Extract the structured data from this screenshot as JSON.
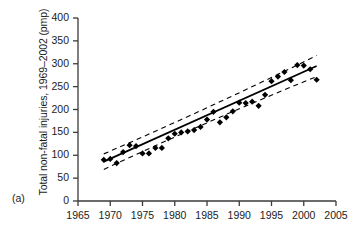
{
  "panel": {
    "label": "(a)"
  },
  "chart_data": {
    "type": "scatter",
    "title": "",
    "subtitle": "",
    "xlabel": "",
    "ylabel": "Total non-fatal injuries, 1969–2002 (pmp)",
    "xlim": [
      1965,
      2005
    ],
    "ylim": [
      0,
      400
    ],
    "xticks": [
      1965,
      1970,
      1975,
      1980,
      1985,
      1990,
      1995,
      2000,
      2005
    ],
    "yticks": [
      0,
      50,
      100,
      150,
      200,
      250,
      300,
      350,
      400
    ],
    "grid": false,
    "legend": null,
    "legend_position": "none",
    "marker": "diamond",
    "marker_color": "#000000",
    "line_color": "#000000",
    "band_color": "#000000",
    "band_style": "dashed",
    "annotations": [],
    "x": [
      1969,
      1970,
      1971,
      1972,
      1973,
      1974,
      1975,
      1976,
      1977,
      1978,
      1979,
      1980,
      1981,
      1982,
      1983,
      1984,
      1985,
      1986,
      1987,
      1988,
      1989,
      1990,
      1991,
      1992,
      1993,
      1994,
      1995,
      1996,
      1997,
      1998,
      1999,
      2000,
      2001,
      2002
    ],
    "values": [
      90,
      92,
      83,
      107,
      122,
      120,
      104,
      104,
      116,
      116,
      137,
      147,
      150,
      152,
      155,
      162,
      178,
      195,
      172,
      183,
      196,
      215,
      214,
      217,
      208,
      232,
      262,
      272,
      282,
      264,
      297,
      296,
      288,
      265
    ],
    "series": [
      {
        "name": "Annual observations",
        "type": "scatter",
        "values": [
          90,
          92,
          83,
          107,
          122,
          120,
          104,
          104,
          116,
          116,
          137,
          147,
          150,
          152,
          155,
          162,
          178,
          195,
          172,
          183,
          196,
          215,
          214,
          217,
          208,
          232,
          262,
          272,
          282,
          264,
          297,
          296,
          288,
          265
        ]
      },
      {
        "name": "Linear regression fit",
        "type": "line",
        "x": [
          1969,
          2002
        ],
        "values": [
          86,
          295
        ]
      },
      {
        "name": "Upper confidence band",
        "type": "line",
        "style": "dashed",
        "x": [
          1969,
          2002
        ],
        "values": [
          103,
          318
        ]
      },
      {
        "name": "Lower confidence band",
        "type": "line",
        "style": "dashed",
        "x": [
          1969,
          2002
        ],
        "values": [
          69,
          272
        ]
      }
    ]
  }
}
